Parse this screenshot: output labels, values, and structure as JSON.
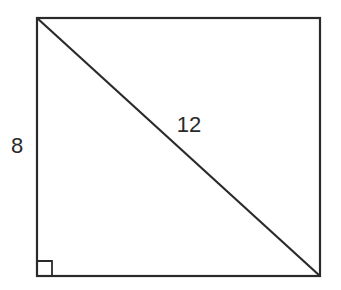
{
  "figure": {
    "shape": "rectangle",
    "diagonal": "top-left to bottom-right",
    "right_angle_marker": "bottom-left corner",
    "labels": {
      "side": "8",
      "diagonal": "12"
    },
    "stroke_color": "#2a2a2a",
    "background_color": "#ffffff"
  }
}
